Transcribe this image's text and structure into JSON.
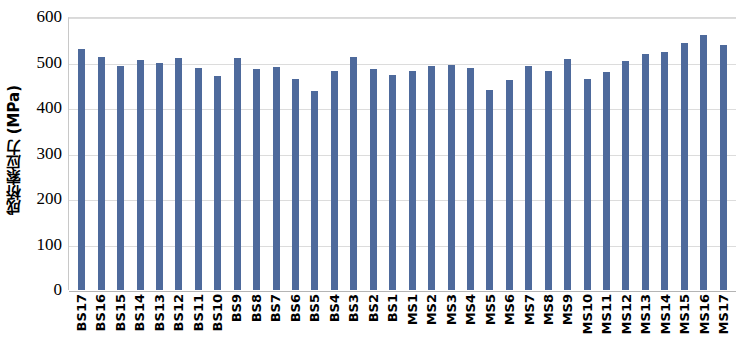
{
  "chart_data": {
    "type": "bar",
    "title": "",
    "xlabel": "",
    "ylabel": "成桥索应力 (MPa)",
    "ylim": [
      0,
      600
    ],
    "ytick_values": [
      0,
      100,
      200,
      300,
      400,
      500,
      600
    ],
    "ytick_labels": [
      "0",
      "100",
      "200",
      "300",
      "400",
      "500",
      "600"
    ],
    "grid": true,
    "legend": "none",
    "bar_color": "#4e6a9c",
    "categories": [
      "BS17",
      "BS16",
      "BS15",
      "BS14",
      "BS13",
      "BS12",
      "BS11",
      "BS10",
      "BS9",
      "BS8",
      "BS7",
      "BS6",
      "BS5",
      "BS4",
      "BS3",
      "BS2",
      "BS1",
      "MS1",
      "MS2",
      "MS3",
      "MS4",
      "MS5",
      "MS6",
      "MS7",
      "MS8",
      "MS9",
      "MS10",
      "MS11",
      "MS12",
      "MS13",
      "MS14",
      "MS15",
      "MS16",
      "MS17"
    ],
    "values": [
      531,
      515,
      494,
      507,
      500,
      512,
      489,
      473,
      512,
      487,
      491,
      466,
      439,
      484,
      515,
      487,
      474,
      483,
      494,
      497,
      490,
      442,
      463,
      494,
      483,
      510,
      465,
      481,
      506,
      521,
      524,
      545,
      562,
      540
    ],
    "units": "MPa"
  }
}
